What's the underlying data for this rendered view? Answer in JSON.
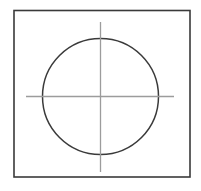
{
  "figure": {
    "canvas": {
      "width": 201,
      "height": 191,
      "background_color": "#ffffff"
    },
    "colors": {
      "outline_stroke": "#3a3a3a",
      "circle_stroke": "#3a3a3a",
      "centerline_stroke": "#9c9c9c",
      "fill": "#ffffff"
    },
    "shapes": {
      "outer_rectangle": {
        "label": "outer square boundary",
        "x": 14,
        "y": 10.5,
        "width": 176,
        "height": 166.5,
        "stroke_width": 1.6,
        "fill": "none"
      },
      "circle": {
        "label": "inscribed circle",
        "center_x": 100.5,
        "center_y": 96.5,
        "radius": 58,
        "diameter": 116,
        "stroke_width": 1.5,
        "fill": "none"
      },
      "horizontal_centerline": {
        "label": "horizontal center axis",
        "x1": 26,
        "y1": 96.5,
        "x2": 174,
        "y2": 96.5,
        "stroke_width": 1.3
      },
      "vertical_centerline": {
        "label": "vertical center axis",
        "x1": 100.5,
        "y1": 22,
        "x2": 100.5,
        "y2": 172,
        "stroke_width": 1.3
      },
      "center_mark": {
        "label": "center point",
        "x": 100.5,
        "y": 96.5
      }
    }
  }
}
